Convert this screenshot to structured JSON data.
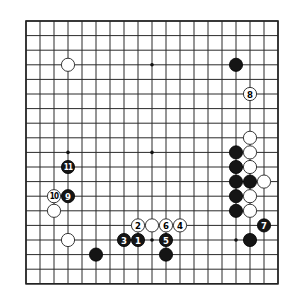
{
  "diagram": {
    "type": "go-board",
    "size": 19,
    "line_color": "#2a2a2a",
    "background": "#ffffff",
    "star_points": [
      [
        3,
        3
      ],
      [
        9,
        3
      ],
      [
        15,
        3
      ],
      [
        3,
        9
      ],
      [
        9,
        9
      ],
      [
        15,
        9
      ],
      [
        3,
        15
      ],
      [
        9,
        15
      ],
      [
        15,
        15
      ]
    ],
    "stones": [
      {
        "color": "white",
        "col": 3,
        "row": 3,
        "label": ""
      },
      {
        "color": "black",
        "col": 15,
        "row": 3,
        "label": ""
      },
      {
        "color": "white",
        "col": 16,
        "row": 5,
        "label": "8"
      },
      {
        "color": "white",
        "col": 16,
        "row": 8,
        "label": ""
      },
      {
        "color": "black",
        "col": 15,
        "row": 9,
        "label": ""
      },
      {
        "color": "white",
        "col": 16,
        "row": 9,
        "label": ""
      },
      {
        "color": "black",
        "col": 15,
        "row": 10,
        "label": ""
      },
      {
        "color": "white",
        "col": 16,
        "row": 10,
        "label": ""
      },
      {
        "color": "black",
        "col": 3,
        "row": 10,
        "label": "11"
      },
      {
        "color": "black",
        "col": 15,
        "row": 11,
        "label": ""
      },
      {
        "color": "black",
        "col": 16,
        "row": 11,
        "label": ""
      },
      {
        "color": "white",
        "col": 17,
        "row": 11,
        "label": ""
      },
      {
        "color": "black",
        "col": 3,
        "row": 12,
        "label": "9"
      },
      {
        "color": "white",
        "col": 2,
        "row": 12,
        "label": "10"
      },
      {
        "color": "black",
        "col": 15,
        "row": 12,
        "label": ""
      },
      {
        "color": "white",
        "col": 16,
        "row": 12,
        "label": ""
      },
      {
        "color": "white",
        "col": 2,
        "row": 13,
        "label": ""
      },
      {
        "color": "black",
        "col": 15,
        "row": 13,
        "label": ""
      },
      {
        "color": "white",
        "col": 16,
        "row": 13,
        "label": ""
      },
      {
        "color": "white",
        "col": 8,
        "row": 14,
        "label": "2"
      },
      {
        "color": "white",
        "col": 9,
        "row": 14,
        "label": ""
      },
      {
        "color": "white",
        "col": 10,
        "row": 14,
        "label": "6"
      },
      {
        "color": "white",
        "col": 11,
        "row": 14,
        "label": "4"
      },
      {
        "color": "black",
        "col": 17,
        "row": 14,
        "label": "7"
      },
      {
        "color": "white",
        "col": 3,
        "row": 15,
        "label": ""
      },
      {
        "color": "black",
        "col": 7,
        "row": 15,
        "label": "3"
      },
      {
        "color": "black",
        "col": 8,
        "row": 15,
        "label": "1"
      },
      {
        "color": "black",
        "col": 10,
        "row": 15,
        "label": "5"
      },
      {
        "color": "black",
        "col": 16,
        "row": 15,
        "label": ""
      },
      {
        "color": "black",
        "col": 5,
        "row": 16,
        "label": ""
      },
      {
        "color": "black",
        "col": 10,
        "row": 16,
        "label": ""
      }
    ]
  }
}
